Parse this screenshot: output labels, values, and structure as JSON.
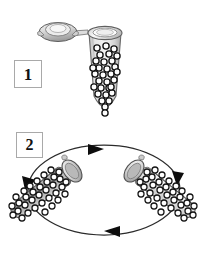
{
  "figure": {
    "background_color": "#ffffff",
    "width": 210,
    "height": 254
  },
  "panels": [
    {
      "id": "panel-1",
      "step_label": "1",
      "description": "Open microcentrifuge tube containing beads",
      "objects": [
        {
          "name": "tube-cap-open",
          "state": "open",
          "orientation": "hinged-left"
        },
        {
          "name": "microcentrifuge-tube",
          "orientation": "upright",
          "contents": "beads",
          "bead_count": 31
        }
      ]
    },
    {
      "id": "panel-2",
      "step_label": "2",
      "description": "Capped tubes rotating along a circular orbit",
      "objects": [
        {
          "name": "tube-left",
          "state": "closed",
          "orientation": "tilted-down-left",
          "contents": "beads",
          "bead_count": 34,
          "fill_tone": "#a8a8a8"
        },
        {
          "name": "tube-right",
          "state": "closed",
          "orientation": "tilted-down-right",
          "contents": "beads",
          "bead_count": 34,
          "fill_tone": "#d8d8d8"
        }
      ],
      "rotation_path": {
        "name": "rotation-ellipse",
        "shape": "ellipse",
        "direction": "clockwise",
        "arrow_count": 4,
        "arrow_positions": [
          "top",
          "right",
          "bottom",
          "left"
        ]
      }
    }
  ],
  "colors": {
    "outline": "#4a4a4a",
    "bead_ring": "#1a1a1a",
    "bead_fill": "#ffffff",
    "tube_body_light": "#e8e8e8",
    "tube_body_mid": "#c6c6c6",
    "tube_body_dark": "#9a9a9a",
    "cap_fill": "#d9d9d9",
    "arrow": "#101010",
    "box_border": "#a9a9a9",
    "label_text": "#111111"
  }
}
